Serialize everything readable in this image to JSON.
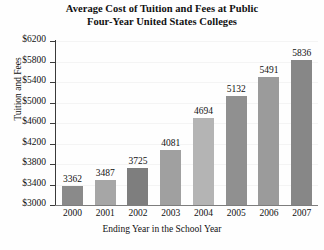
{
  "chart_data": {
    "type": "bar",
    "title": "Average Cost of Tuition and Fees at Public Four-Year United States Colleges",
    "title_lines": [
      "Average Cost of Tuition and Fees at Public",
      "Four-Year United States Colleges"
    ],
    "xlabel": "Ending Year in the School Year",
    "ylabel": "Tuition and Fees",
    "categories": [
      "2000",
      "2001",
      "2002",
      "2003",
      "2004",
      "2005",
      "2006",
      "2007"
    ],
    "values": [
      3362,
      3487,
      3725,
      4081,
      4694,
      5132,
      5491,
      5836
    ],
    "value_labels": [
      "3362",
      "3487",
      "3725",
      "4081",
      "4694",
      "5132",
      "5491",
      "5836"
    ],
    "bar_colors": [
      "#8a8a8a",
      "#a6a6a6",
      "#7e7e7e",
      "#a0a0a0",
      "#b4b4b4",
      "#909090",
      "#9b9b9b",
      "#878787"
    ],
    "ylim": [
      3000,
      6200
    ],
    "ytick_values": [
      3000,
      3400,
      3800,
      4200,
      4600,
      5000,
      5400,
      5800,
      6200
    ],
    "ytick_labels": [
      "$3000",
      "$3400",
      "$3800",
      "$4200",
      "$4600",
      "$5000",
      "$5400",
      "$5800",
      "$6200"
    ],
    "grid": true,
    "grid_axis": "y",
    "legend": false
  }
}
